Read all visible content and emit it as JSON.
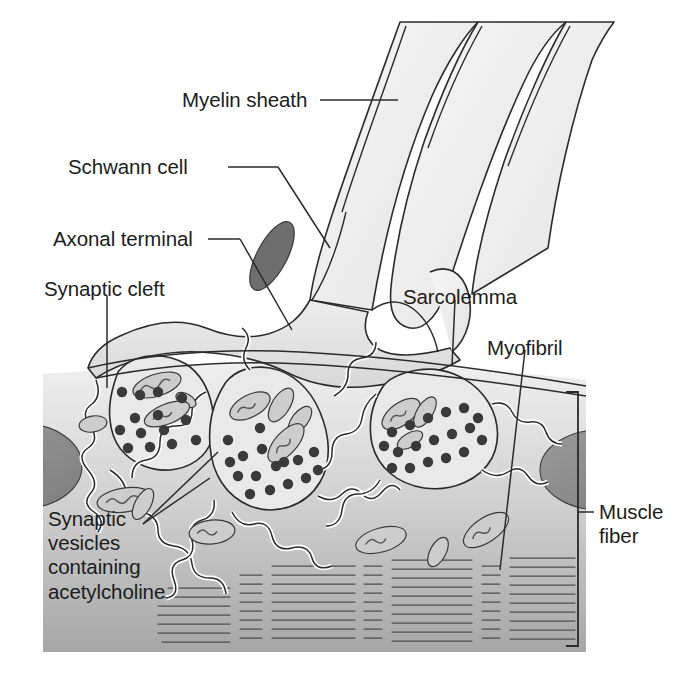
{
  "figure": {
    "type": "labeled biological diagram",
    "background_color": "#ffffff",
    "line_color": "#2b2b2b"
  },
  "labels": [
    {
      "id": "myelin-sheath",
      "text": "Myelin sheath",
      "x": 182,
      "y": 88,
      "align": "left"
    },
    {
      "id": "schwann-cell",
      "text": "Schwann cell",
      "x": 68,
      "y": 155,
      "align": "left"
    },
    {
      "id": "axonal-terminal",
      "text": "Axonal terminal",
      "x": 53,
      "y": 227,
      "align": "left"
    },
    {
      "id": "synaptic-cleft",
      "text": "Synaptic cleft",
      "x": 44,
      "y": 277,
      "align": "left"
    },
    {
      "id": "sarcolemma",
      "text": "Sarcolemma",
      "x": 403,
      "y": 285,
      "align": "left"
    },
    {
      "id": "myofibril",
      "text": "Myofibril",
      "x": 487,
      "y": 336,
      "align": "left"
    },
    {
      "id": "muscle-fiber",
      "text": "Muscle\nfiber",
      "x": 599,
      "y": 500,
      "align": "left"
    },
    {
      "id": "synaptic-vesicles",
      "text": "Synaptic\nvesicles\ncontaining\nacetylcholine",
      "x": 48,
      "y": 507,
      "align": "left"
    }
  ],
  "colors": {
    "white": "#ffffff",
    "axon_fill": "#f2f2f2",
    "myelin_fill": "#fbfbfb",
    "terminal_fill": "#e6e6e6",
    "muscle_top": "#ededed",
    "muscle_bottom": "#a9a9a9",
    "nucleus_fill": "#8f8f8f",
    "schwann_nucleus": "#6e6e6e",
    "vesicle_fill": "#3a3a3a",
    "mitochondria_fill": "#c9c9c9",
    "outline": "#2b2b2b",
    "striation": "#555555"
  },
  "structures": {
    "axon": "myelinated motor axon descending from upper right",
    "myelin_layers": 3,
    "schwann_cell_nucleus": "dark ellipse on axon terminal",
    "axonal_terminals": 3,
    "mitochondria_count": 18,
    "synaptic_vesicle_count": 62,
    "junctional_folds": "wavy membrane infoldings beneath each terminal",
    "muscle_nuclei": 2,
    "myofibril_striation_groups": 7,
    "muscle_fiber_bracket": "right-side bracket spanning the muscle fiber"
  }
}
